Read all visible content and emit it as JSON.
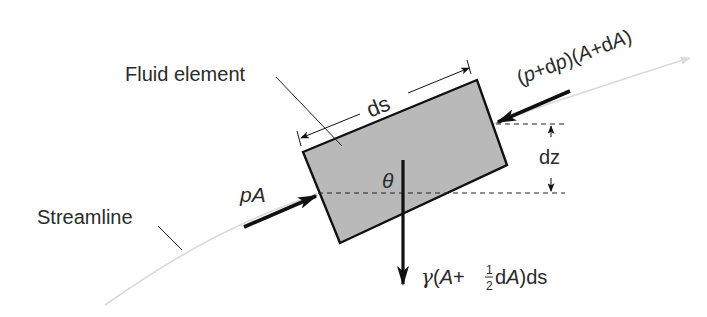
{
  "diagram": {
    "colors": {
      "element_fill": "#b9b9b9",
      "stroke": "#111111",
      "streamline": "#d6d6d6",
      "text": "#2a2a2a",
      "background": "#ffffff"
    },
    "labels": {
      "fluid_element": "Fluid element",
      "streamline": "Streamline",
      "ds": "ds",
      "dz": "dz",
      "theta": "θ",
      "pA_p": "p",
      "pA_A": "A",
      "upstream_force_parts": [
        "(",
        "p",
        "+d",
        "p",
        ")(",
        "A",
        "+d",
        "A",
        ")"
      ],
      "weight_parts": {
        "gamma": "γ",
        "open": "(",
        "A1": "A",
        "plus": "+",
        "frac_num": "1",
        "frac_den": "2",
        "dA_d": "d",
        "dA_A": "A",
        "close_ds": ")ds"
      }
    },
    "nodes": [
      {
        "id": "fluid-element",
        "shape": "rotated-rectangle",
        "label": "Fluid element"
      },
      {
        "id": "streamline",
        "shape": "curve",
        "label": "Streamline"
      }
    ],
    "forces": [
      {
        "id": "pA",
        "label": "pA",
        "direction": "along streamline, into left face"
      },
      {
        "id": "p_dp_A_dA",
        "label": "(p+dp)(A+dA)",
        "direction": "against streamline, into right face"
      },
      {
        "id": "weight",
        "label": "γ(A+½dA)ds",
        "direction": "vertically downward"
      }
    ],
    "dimensions": [
      {
        "id": "ds",
        "label": "ds",
        "meaning": "length of element along streamline"
      },
      {
        "id": "dz",
        "label": "dz",
        "meaning": "vertical rise across element"
      },
      {
        "id": "theta",
        "label": "θ",
        "meaning": "angle between vertical and element normal"
      }
    ]
  }
}
